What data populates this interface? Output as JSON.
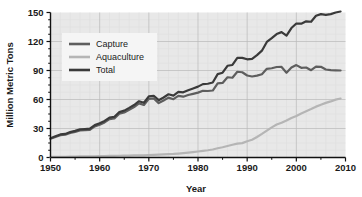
{
  "chart_data": {
    "type": "line",
    "title": "",
    "xlabel": "Year",
    "ylabel": "Million Metric Tons",
    "xlim": [
      1950,
      2010
    ],
    "ylim": [
      0,
      150
    ],
    "xticks": [
      1950,
      1960,
      1970,
      1980,
      1990,
      2000,
      2010
    ],
    "yticks": [
      0,
      30,
      60,
      90,
      120,
      150
    ],
    "xtick_labels": [
      "1950",
      "1960",
      "1970",
      "1980",
      "1990",
      "2000",
      "2010"
    ],
    "ytick_labels": [
      "0",
      "30",
      "60",
      "90",
      "120",
      "150"
    ],
    "grid": true,
    "minor_grid": true,
    "legend_position": "upper-left",
    "plot_background": "#e8e8e8",
    "x": [
      1950,
      1951,
      1952,
      1953,
      1954,
      1955,
      1956,
      1957,
      1958,
      1959,
      1960,
      1961,
      1962,
      1963,
      1964,
      1965,
      1966,
      1967,
      1968,
      1969,
      1970,
      1971,
      1972,
      1973,
      1974,
      1975,
      1976,
      1977,
      1978,
      1979,
      1980,
      1981,
      1982,
      1983,
      1984,
      1985,
      1986,
      1987,
      1988,
      1989,
      1990,
      1991,
      1992,
      1993,
      1994,
      1995,
      1996,
      1997,
      1998,
      1999,
      2000,
      2001,
      2002,
      2003,
      2004,
      2005,
      2006,
      2007,
      2008,
      2009
    ],
    "series": [
      {
        "name": "Capture",
        "color": "#5e5e5e",
        "values": [
          19.3,
          21.2,
          23.1,
          23.6,
          25.4,
          26.5,
          28.0,
          28.3,
          28.6,
          32.2,
          34.0,
          36.3,
          39.7,
          40.5,
          45.2,
          46.6,
          49.3,
          52.2,
          56.0,
          54.3,
          60.6,
          61.1,
          56.3,
          58.9,
          61.9,
          60.3,
          63.7,
          62.9,
          64.6,
          65.8,
          67.1,
          69.0,
          68.8,
          69.3,
          76.7,
          77.1,
          83.0,
          82.5,
          88.7,
          88.2,
          84.8,
          83.8,
          84.7,
          86.1,
          91.7,
          92.3,
          93.6,
          93.7,
          87.7,
          93.0,
          95.6,
          92.8,
          93.1,
          90.3,
          94.0,
          93.8,
          91.0,
          90.3,
          90.1,
          90.0
        ]
      },
      {
        "name": "Aquaculture",
        "color": "#b5b5b5",
        "values": [
          0.6,
          0.7,
          0.8,
          0.8,
          0.9,
          1.0,
          1.1,
          1.1,
          1.2,
          1.3,
          1.4,
          1.5,
          1.6,
          1.7,
          1.8,
          1.9,
          2.0,
          2.1,
          2.2,
          2.3,
          2.6,
          2.8,
          3.0,
          3.2,
          3.5,
          3.7,
          4.1,
          4.5,
          5.0,
          5.6,
          6.2,
          6.9,
          7.5,
          8.3,
          9.6,
          10.6,
          11.9,
          13.2,
          14.4,
          14.9,
          16.8,
          18.3,
          21.2,
          24.4,
          27.8,
          31.2,
          34.1,
          36.0,
          38.3,
          40.9,
          43.0,
          45.6,
          47.8,
          50.1,
          52.6,
          54.5,
          56.5,
          58.0,
          59.9,
          61.0
        ]
      },
      {
        "name": "Total",
        "color": "#3a3a3a",
        "values": [
          19.9,
          21.9,
          23.9,
          24.4,
          26.3,
          27.5,
          29.1,
          29.4,
          29.8,
          33.5,
          35.4,
          37.8,
          41.3,
          42.2,
          47.0,
          48.5,
          51.3,
          54.3,
          58.2,
          56.6,
          63.2,
          63.9,
          59.3,
          62.1,
          65.4,
          64.0,
          67.8,
          67.4,
          69.6,
          71.4,
          73.3,
          75.9,
          76.3,
          77.6,
          86.3,
          87.7,
          94.9,
          95.7,
          103.1,
          103.1,
          101.6,
          102.1,
          105.9,
          110.5,
          119.5,
          123.5,
          127.7,
          129.7,
          126.0,
          133.9,
          138.6,
          138.4,
          140.9,
          140.4,
          146.6,
          148.3,
          147.5,
          148.3,
          150.0,
          151.0
        ]
      }
    ]
  },
  "legend": {
    "items": [
      {
        "label": "Capture"
      },
      {
        "label": "Aquaculture"
      },
      {
        "label": "Total"
      }
    ]
  }
}
